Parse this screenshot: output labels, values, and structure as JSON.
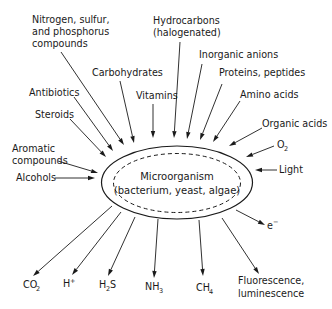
{
  "center": {
    "line1": "Microorganism",
    "line2": "(bacterium, yeast, algae)"
  },
  "inputs": [
    {
      "id": "nitrogen",
      "lines": [
        "Nitrogen, sulfur,",
        "and phosphorus",
        "compounds"
      ]
    },
    {
      "id": "hydrocarbons",
      "lines": [
        "Hydrocarbons",
        "(halogenated)"
      ]
    },
    {
      "id": "carbohydrates",
      "lines": [
        "Carbohydrates"
      ]
    },
    {
      "id": "inorganic-anions",
      "lines": [
        "Inorganic anions"
      ]
    },
    {
      "id": "proteins",
      "lines": [
        "Proteins, peptides"
      ]
    },
    {
      "id": "antibiotics",
      "lines": [
        "Antibiotics"
      ]
    },
    {
      "id": "vitamins",
      "lines": [
        "Vitamins"
      ]
    },
    {
      "id": "amino-acids",
      "lines": [
        "Amino acids"
      ]
    },
    {
      "id": "steroids",
      "lines": [
        "Steroids"
      ]
    },
    {
      "id": "organic-acids",
      "lines": [
        "Organic acids"
      ]
    },
    {
      "id": "aromatic",
      "lines": [
        "Aromatic",
        "compounds"
      ]
    },
    {
      "id": "o2",
      "lines": [
        "O",
        "2"
      ]
    },
    {
      "id": "alcohols",
      "lines": [
        "Alcohols"
      ]
    },
    {
      "id": "light",
      "lines": [
        "Light"
      ]
    }
  ],
  "outputs": [
    {
      "id": "electron",
      "base": "e",
      "sup": "−"
    },
    {
      "id": "co2",
      "base": "CO",
      "sub": "2"
    },
    {
      "id": "h-plus",
      "base": "H",
      "sup": "+"
    },
    {
      "id": "h2s",
      "base": "H",
      "sub": "2",
      "tail": "S"
    },
    {
      "id": "nh3",
      "base": "NH",
      "sub": "3"
    },
    {
      "id": "ch4",
      "base": "CH",
      "sub": "4"
    },
    {
      "id": "fluorescence",
      "lines": [
        "Fluorescence,",
        "luminescence"
      ]
    }
  ]
}
